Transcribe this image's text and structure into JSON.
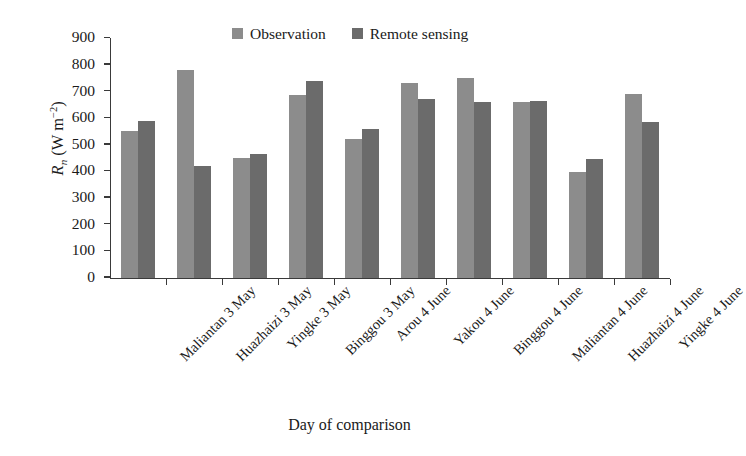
{
  "chart_data": {
    "type": "bar",
    "title": "",
    "xlabel": "Day of comparison",
    "ylabel": "R_n (W m^-2)",
    "ylabel_parts": {
      "symbol": "R",
      "subscript": "n",
      "units_open": " (W m",
      "units_exp": "−2",
      "units_close": ")"
    },
    "categories": [
      "Maliantan 3 May",
      "Huazhaizi 3 May",
      "Yingke 3 May",
      "Binggou 3 May",
      "Arou 4 June",
      "Yakou 4 June",
      "Binggou 4 June",
      "Maliantan 4 June",
      "Huazhaizi 4 June",
      "Yingke 4 June"
    ],
    "series": [
      {
        "name": "Observation",
        "color": "#8c8c8c",
        "values": [
          550,
          780,
          450,
          685,
          520,
          730,
          750,
          660,
          395,
          690
        ]
      },
      {
        "name": "Remote sensing",
        "color": "#6b6b6b",
        "values": [
          590,
          420,
          465,
          740,
          560,
          670,
          660,
          665,
          445,
          585
        ]
      }
    ],
    "ylim": [
      0,
      900
    ],
    "ytick_labels": [
      "900",
      "800",
      "700",
      "600",
      "500",
      "400",
      "300",
      "200",
      "100",
      "0"
    ],
    "ytick_values": [
      900,
      800,
      700,
      600,
      500,
      400,
      300,
      200,
      100,
      0
    ],
    "ytick_step": 100,
    "grid": false,
    "legend_position": "top-center"
  }
}
